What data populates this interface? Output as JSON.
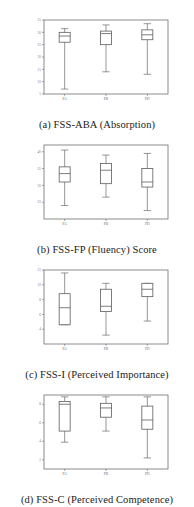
{
  "figure": {
    "panel_count": 4,
    "group_labels": [
      "PA",
      "PB",
      "PD"
    ]
  },
  "panels": [
    {
      "letter": "(a)",
      "caption": "(a)  FSS-ABA (Absorption)",
      "chart_data": {
        "type": "box",
        "title": "FSS-ABA (Absorption)",
        "xlabel": "",
        "ylabel": "",
        "categories": [
          "PA",
          "PB",
          "PD"
        ],
        "ylim": [
          5,
          35
        ],
        "yticks": [
          5,
          10,
          15,
          20,
          25,
          30,
          35
        ],
        "ytick_labels": [
          "5",
          "10",
          "15",
          "20",
          "25",
          "30",
          "35"
        ],
        "grid": false,
        "legend": "none",
        "series": [
          {
            "name": "PA",
            "min": 7.0,
            "q1": 26.0,
            "median": 28.5,
            "q3": 30.0,
            "max": 31.5
          },
          {
            "name": "PB",
            "min": 14.0,
            "q1": 25.0,
            "median": 29.5,
            "q3": 30.5,
            "max": 33.0
          },
          {
            "name": "PD",
            "min": 13.0,
            "q1": 27.0,
            "median": 29.0,
            "q3": 31.0,
            "max": 33.5
          }
        ]
      }
    },
    {
      "letter": "(b)",
      "caption": "(b)  FSS-FP (Fluency) Score",
      "chart_data": {
        "type": "box",
        "title": "FSS-FP (Fluency) Score",
        "xlabel": "",
        "ylabel": "",
        "categories": [
          "PA",
          "PB",
          "PD"
        ],
        "ylim": [
          20,
          42
        ],
        "yticks": [
          25,
          30,
          35,
          40
        ],
        "ytick_labels": [
          "25",
          "30",
          "35",
          "40"
        ],
        "grid": false,
        "legend": "none",
        "series": [
          {
            "name": "PA",
            "min": 24.0,
            "q1": 31.0,
            "median": 33.5,
            "q3": 35.5,
            "max": 40.5
          },
          {
            "name": "PB",
            "min": 26.5,
            "q1": 30.5,
            "median": 34.5,
            "q3": 36.5,
            "max": 39.0
          },
          {
            "name": "PD",
            "min": 22.5,
            "q1": 29.5,
            "median": 31.0,
            "q3": 35.0,
            "max": 39.5
          }
        ]
      }
    },
    {
      "letter": "(c)",
      "caption": "(c)  FSS-I (Perceived Importance)",
      "chart_data": {
        "type": "box",
        "title": "FSS-I (Perceived Importance)",
        "xlabel": "",
        "ylabel": "",
        "categories": [
          "PA",
          "PB",
          "PD"
        ],
        "ylim": [
          2,
          12
        ],
        "yticks": [
          4,
          6,
          8,
          10,
          12
        ],
        "ytick_labels": [
          "4",
          "6",
          "8",
          "10",
          "12"
        ],
        "grid": false,
        "legend": "none",
        "series": [
          {
            "name": "PA",
            "min": 4.6,
            "q1": 4.6,
            "median": 6.9,
            "q3": 8.8,
            "max": 11.6
          },
          {
            "name": "PB",
            "min": 3.2,
            "q1": 6.4,
            "median": 7.1,
            "q3": 9.4,
            "max": 10.2
          },
          {
            "name": "PD",
            "min": 5.1,
            "q1": 8.4,
            "median": 9.4,
            "q3": 10.2,
            "max": 10.2
          }
        ]
      }
    },
    {
      "letter": "(d)",
      "caption": "(d)  FSS-C (Perceived Competence)",
      "chart_data": {
        "type": "box",
        "title": "FSS-C (Perceived Competence)",
        "xlabel": "",
        "ylabel": "",
        "categories": [
          "PA",
          "PB",
          "PD"
        ],
        "ylim": [
          1,
          9
        ],
        "yticks": [
          2,
          4,
          6,
          8
        ],
        "ytick_labels": [
          "2",
          "4",
          "6",
          "8"
        ],
        "grid": false,
        "legend": "none",
        "series": [
          {
            "name": "PA",
            "min": 3.9,
            "q1": 5.1,
            "median": 8.0,
            "q3": 8.3,
            "max": 8.8
          },
          {
            "name": "PB",
            "min": 5.1,
            "q1": 6.6,
            "median": 7.6,
            "q3": 8.1,
            "max": 8.8
          },
          {
            "name": "PD",
            "min": 2.2,
            "q1": 5.3,
            "median": 6.3,
            "q3": 7.8,
            "max": 8.8
          }
        ]
      }
    }
  ]
}
